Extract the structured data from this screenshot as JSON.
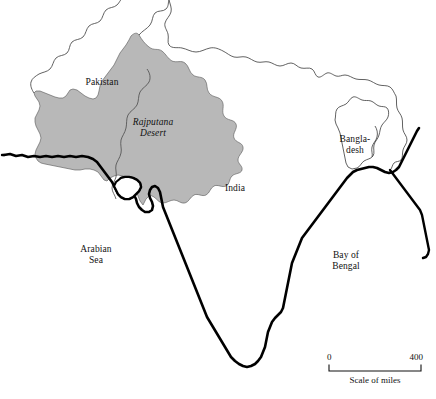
{
  "map": {
    "title": "Rajputana Desert map of the Indian subcontinent",
    "colors": {
      "desert_fill": "#b8b8b8",
      "coastline": "#000000",
      "border": "#3a3a3a",
      "text": "#111111",
      "background": "#ffffff"
    },
    "labels": [
      {
        "id": "pakistan",
        "name": "Pakistan",
        "text": "Pakistan",
        "style": "country",
        "x": 95,
        "y": 84
      },
      {
        "id": "india",
        "name": "India",
        "text": "India",
        "style": "country",
        "x": 234,
        "y": 190
      },
      {
        "id": "bangladesh",
        "name": "Bangladesh",
        "text": "Bangla-\ndesh",
        "style": "country",
        "x": 355,
        "y": 142
      },
      {
        "id": "rajputana-desert",
        "name": "Rajputana Desert",
        "text": "Rajputana\nDesert",
        "style": "desert",
        "x": 152,
        "y": 124
      },
      {
        "id": "arabian-sea",
        "name": "Arabian Sea",
        "text": "Arabian\nSea",
        "style": "water",
        "x": 95,
        "y": 252
      },
      {
        "id": "bay-of-bengal",
        "name": "Bay of Bengal",
        "text": "Bay of\nBengal",
        "style": "water",
        "x": 345,
        "y": 258
      }
    ],
    "scale": {
      "start_label": "0",
      "end_label": "400",
      "caption": "Scale of miles",
      "units": "miles",
      "span_value": 400
    }
  }
}
